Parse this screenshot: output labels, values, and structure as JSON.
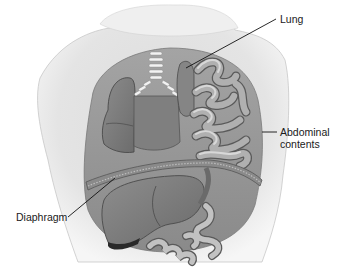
{
  "diagram": {
    "type": "medical-illustration",
    "labels": [
      {
        "id": "lung",
        "text": "Lung"
      },
      {
        "id": "abdominal",
        "line1": "Abdominal",
        "line2": "contents"
      },
      {
        "id": "diaphragm",
        "text": "Diaphragm"
      }
    ]
  },
  "colors": {
    "background": "#ffffff",
    "skin": "#e6e6e6",
    "skin_shadow": "#bdbdbd",
    "cavity": "#9a9a9a",
    "organ": "#7d7d7d",
    "organ_dark": "#5e5e5e",
    "intestine": "#a8a8a8",
    "intestine_highlight": "#d4d4d4",
    "leader_line": "#111111"
  }
}
